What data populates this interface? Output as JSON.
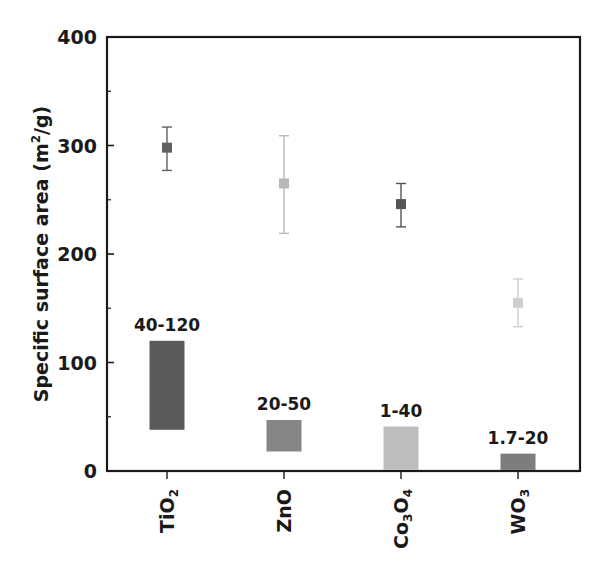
{
  "chart_data": {
    "type": "bar",
    "title": "",
    "xlabel": "",
    "ylabel": "Specific surface area (m²/g)",
    "ylabel_parts": {
      "main": "Specific surface area (m",
      "sup": "2",
      "tail": "/g)"
    },
    "ylim": [
      0,
      400
    ],
    "yticks": [
      0,
      100,
      200,
      300,
      400
    ],
    "minor_yticks": [
      50,
      150,
      250,
      350
    ],
    "grid": false,
    "legend": null,
    "categories": [
      "TiO2",
      "ZnO",
      "Co3O4",
      "WO3"
    ],
    "category_labels": [
      {
        "base": "TiO",
        "sub": "2"
      },
      {
        "base": "ZnO",
        "sub": ""
      },
      {
        "base": "Co",
        "sub": "3",
        "base2": "O",
        "sub2": "4"
      },
      {
        "base": "WO",
        "sub": "3"
      }
    ],
    "series": [
      {
        "name": "Range bars (floating)",
        "kind": "floating-bar",
        "labels": [
          "40-120",
          "20-50",
          "1-40",
          "1.7-20"
        ],
        "measured_low": [
          38,
          18,
          1,
          1
        ],
        "measured_high": [
          120,
          47,
          41,
          16
        ],
        "colors": [
          "#5a5a5a",
          "#858585",
          "#bdbdbd",
          "#7d7d7d"
        ]
      },
      {
        "name": "Points with error bars",
        "kind": "point-errorbar",
        "values": [
          298,
          265,
          246,
          155
        ],
        "err_high": [
          317,
          309,
          265,
          177
        ],
        "err_low": [
          277,
          219,
          225,
          133
        ],
        "colors": [
          "#606060",
          "#b8b8b8",
          "#555555",
          "#cfcfcf"
        ]
      }
    ]
  }
}
